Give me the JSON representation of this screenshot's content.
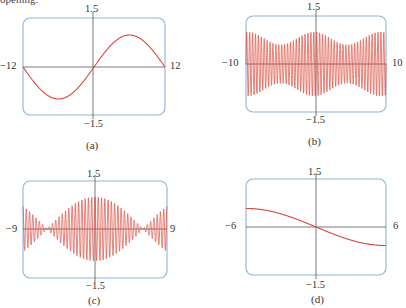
{
  "page": {
    "fragment_text": "opening."
  },
  "chart_data": [
    {
      "id": "a",
      "type": "line",
      "caption": "(a)",
      "xlim": [
        -12,
        12
      ],
      "ylim": [
        -1.5,
        1.5
      ],
      "tick_labels": {
        "top": "1.5",
        "bottom": "−1.5",
        "left": "−12",
        "right": "12"
      },
      "grid": false,
      "series_color": "#d9463a",
      "frame_color": "#8fb3d9",
      "description": "single smooth sine wave, ~1 period, max ~1 at x~6, min ~-1 at x~-6",
      "series": [
        {
          "name": "curve",
          "x": [
            -12,
            -10,
            -8,
            -6,
            -4,
            -2,
            0,
            2,
            4,
            6,
            8,
            10,
            12
          ],
          "y": [
            -0.14,
            -0.6,
            -0.91,
            -1.0,
            -0.84,
            -0.48,
            0,
            0.48,
            0.84,
            1.0,
            0.91,
            0.6,
            0.14
          ]
        }
      ]
    },
    {
      "id": "b",
      "type": "line",
      "caption": "(b)",
      "xlim": [
        -10,
        10
      ],
      "ylim": [
        -1.5,
        1.5
      ],
      "tick_labels": {
        "top": "1.5",
        "bottom": "−1.5",
        "left": "−10",
        "right": "10"
      },
      "grid": false,
      "series_color": "#d9463a",
      "frame_color": "#8fb3d9",
      "description": "rapid oscillation (~48 cycles), amplitude ~1 with envelope dipping to ~0.6 near x~-4.5 and x~5",
      "series": [
        {
          "name": "curve",
          "cycles": 48,
          "amplitude_max": 1.0,
          "amplitude_min": 0.6
        }
      ]
    },
    {
      "id": "c",
      "type": "line",
      "caption": "(c)",
      "xlim": [
        -9,
        9
      ],
      "ylim": [
        -1.5,
        1.5
      ],
      "tick_labels": {
        "top": "1.5",
        "bottom": "−1.5",
        "left": "−9",
        "right": "9"
      },
      "grid": false,
      "series_color": "#d9463a",
      "frame_color": "#8fb3d9",
      "description": "beat pattern: rapid oscillation (~44 cycles) with envelope max ~1 at x=0, nodes at x~±6, ~0.6 at edges",
      "series": [
        {
          "name": "curve",
          "cycles": 44,
          "envelope_peak": 1.0,
          "node_x": [
            -6,
            6
          ],
          "edge_amplitude": 0.6
        }
      ]
    },
    {
      "id": "d",
      "type": "line",
      "caption": "(d)",
      "xlim": [
        -6,
        6
      ],
      "ylim": [
        -1.5,
        1.5
      ],
      "tick_labels": {
        "top": "1.5",
        "bottom": "−1.5",
        "left": "−6",
        "right": "6"
      },
      "grid": false,
      "series_color": "#d9463a",
      "frame_color": "#8fb3d9",
      "description": "smooth decreasing curve from ~0.58 at x=-6 to ~-0.58 at x=6, through origin",
      "series": [
        {
          "name": "curve",
          "x": [
            -6,
            -4,
            -2,
            0,
            2,
            4,
            6
          ],
          "y": [
            0.58,
            0.49,
            0.28,
            0,
            -0.28,
            -0.49,
            -0.58
          ]
        }
      ]
    }
  ]
}
